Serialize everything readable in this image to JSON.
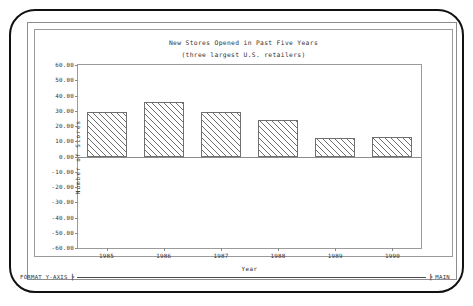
{
  "chart_data": {
    "type": "bar",
    "title": "New Stores Opened in Past Five Years",
    "subtitle": "(three largest U.S. retailers)",
    "xlabel": "Year",
    "ylabel": "Number of Stores",
    "categories": [
      "1985",
      "1986",
      "1987",
      "1988",
      "1989",
      "1990"
    ],
    "values": [
      29,
      35.5,
      29.5,
      24,
      12,
      12.5
    ],
    "ylim": [
      -60,
      60
    ],
    "ytick_labels": [
      "60.00",
      "50.00",
      "40.00",
      "30.00",
      "20.00",
      "10.00",
      "0.00",
      "-10.00",
      "-20.00",
      "-30.00",
      "-40.00",
      "-50.00",
      "-60.00"
    ],
    "ytick_values": [
      60,
      50,
      40,
      30,
      20,
      10,
      0,
      -10,
      -20,
      -30,
      -40,
      -50,
      -60
    ],
    "grid": false,
    "legend": null,
    "bar_fill": "diagonal-hatch",
    "axis_color": "#8b8b8b",
    "bar_outline_color": "#6f6f6f"
  },
  "statusbar": {
    "left_label": "FORMAT Y-AXIS",
    "right_label": "MAIN",
    "left_tick": "┣",
    "right_tick": "┣"
  }
}
